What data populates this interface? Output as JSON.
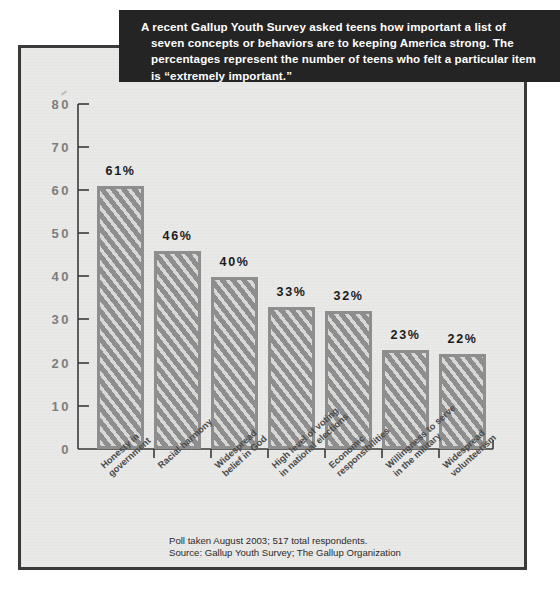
{
  "caption": {
    "lines": [
      "A recent Gallup Youth Survey asked teens how important a list of",
      "seven concepts or behaviors are to keeping America strong. The",
      "percentages represent the number of teens who felt a particular item",
      "is “extremely important.”"
    ]
  },
  "footnote": {
    "line1": "Poll taken August 2003; 517 total respondents.",
    "line2": "Source: Gallup Youth Survey; The Gallup Organization"
  },
  "colors": {
    "bar_fill": "#8e8e8e",
    "bar_hatch": "#d8d8d6",
    "panel_background": "#e9e9e7",
    "panel_border": "#3a3a3a",
    "banner_background": "#242424",
    "banner_text": "#ffffff",
    "axis_label": "#7d7d7d",
    "value_label": "#1b1b1b"
  },
  "chart_data": {
    "type": "bar",
    "title": "",
    "xlabel": "",
    "ylabel": "",
    "ylim": [
      0,
      80
    ],
    "ytick_labels": [
      "80",
      "70",
      "60",
      "50",
      "40",
      "30",
      "20",
      "10",
      "0"
    ],
    "ytick_values": [
      80,
      70,
      60,
      50,
      40,
      30,
      20,
      10,
      0
    ],
    "grid": false,
    "legend": "none",
    "categories": [
      "Honesty in\ngovernment",
      "Racial harmony",
      "Widespread\nbelief in God",
      "High level of voting\nin national elections",
      "Economic\nresponsibilities",
      "Willingness to serve\nin the military",
      "Widespread\nvolunteerism"
    ],
    "values": [
      61,
      46,
      40,
      33,
      32,
      23,
      22
    ],
    "value_labels": [
      "61%",
      "46%",
      "40%",
      "33%",
      "32%",
      "23%",
      "22%"
    ]
  }
}
